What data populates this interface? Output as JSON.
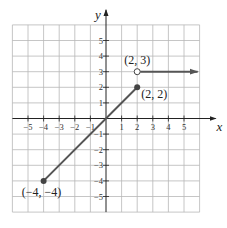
{
  "chart_data": {
    "type": "line",
    "title": "",
    "xlabel": "x",
    "ylabel": "y",
    "xlim": [
      -6,
      6
    ],
    "ylim": [
      -6,
      6
    ],
    "grid": true,
    "x_ticks": [
      -5,
      -4,
      -3,
      -2,
      -1,
      1,
      2,
      3,
      4,
      5
    ],
    "y_ticks": [
      5,
      4,
      3,
      2,
      1,
      -1,
      -2,
      -3,
      -4,
      -5
    ],
    "x_tick_labels": [
      "−5",
      "−4",
      "−3",
      "−2",
      "−1",
      "1",
      "2",
      "3",
      "4",
      "5"
    ],
    "y_tick_labels": [
      "5",
      "4",
      "3",
      "2",
      "1",
      "−1",
      "−2",
      "−3",
      "−4",
      "−5"
    ],
    "series": [
      {
        "name": "segment",
        "points": [
          [
            -4,
            -4
          ],
          [
            2,
            2
          ]
        ],
        "start_marker": "closed",
        "end_marker": "closed"
      },
      {
        "name": "ray",
        "points": [
          [
            2,
            3
          ],
          [
            6,
            3
          ]
        ],
        "start_marker": "open",
        "end_marker": "arrow"
      }
    ],
    "annotations": [
      {
        "text": "(2, 3)",
        "x": 2,
        "y": 3,
        "position": "above"
      },
      {
        "text": "(2, 2)",
        "x": 2,
        "y": 2,
        "position": "right"
      },
      {
        "text": "(−4, −4)",
        "x": -4,
        "y": -4,
        "position": "below-left"
      }
    ]
  },
  "colors": {
    "grid": "#b8b8b8",
    "axis": "#222222",
    "line": "#555555",
    "point": "#444444"
  }
}
